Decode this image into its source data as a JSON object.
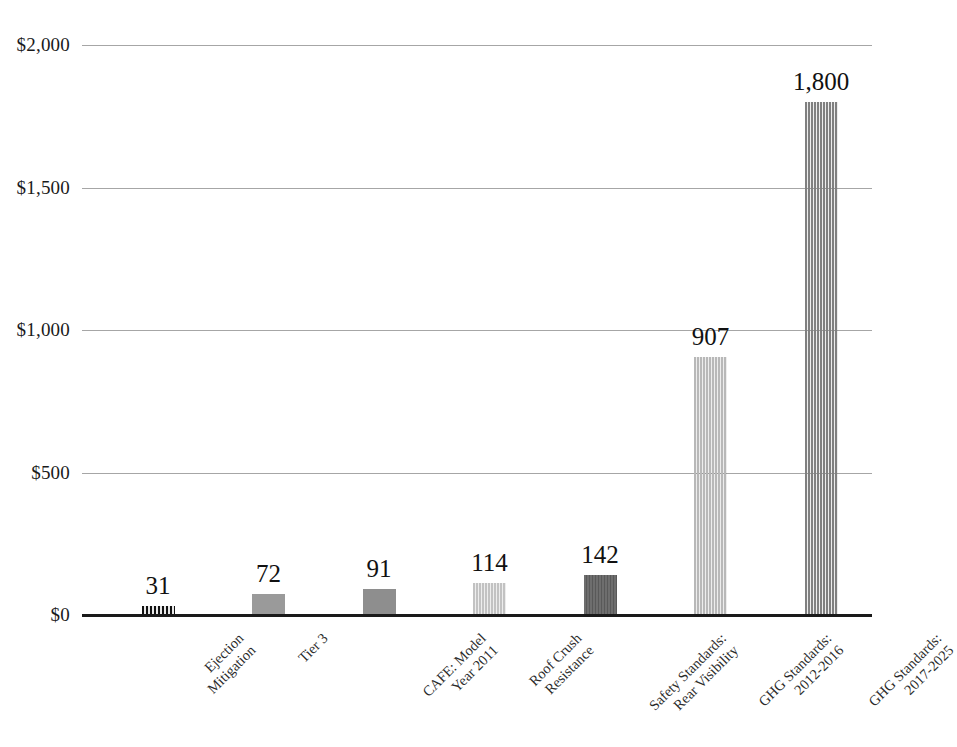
{
  "chart_data": {
    "type": "bar",
    "title": "",
    "subtitle": "",
    "xlabel": "",
    "ylabel": "",
    "ylim": [
      0,
      2000
    ],
    "grid": true,
    "legend": "none",
    "value_prefix": "$",
    "categories": [
      "Ejection Mitigation",
      "Tier 3",
      "CAFE: Model Year 2011",
      "Roof Crush Resistance",
      "Safety Standards: Rear Visibility",
      "GHG Standards: 2012-2016",
      "GHG Standards: 2017-2025"
    ],
    "category_lines": [
      [
        "Ejection",
        "Mitigation"
      ],
      [
        "Tier 3"
      ],
      [
        "CAFE: Model",
        "Year 2011"
      ],
      [
        "Roof Crush",
        "Resistance"
      ],
      [
        "Safety Standards:",
        "Rear Visibility"
      ],
      [
        "GHG Standards:",
        "2012-2016"
      ],
      [
        "GHG Standards:",
        "2017-2025"
      ]
    ],
    "values": [
      31,
      72,
      91,
      114,
      142,
      907,
      1800
    ],
    "value_labels": [
      "31",
      "72",
      "91",
      "114",
      "142",
      "907",
      "1,800"
    ],
    "bar_colors": [
      "#3a3a3a",
      "#9a9a9a",
      "#8e8e8e",
      "#c2c2c2",
      "#6e6e6e",
      "#b8b8b8",
      "#808080"
    ],
    "bar_patterns": [
      "striped-strong",
      "solid",
      "solid",
      "striped-faint",
      "striped-medium",
      "striped-faint",
      "striped-faint"
    ],
    "y_ticks": [
      0,
      500,
      1000,
      1500,
      2000
    ],
    "y_tick_labels": [
      "$0",
      "$500",
      "$1,000",
      "$1,500",
      "$2,000"
    ],
    "gridline_color": "#a6a6a6",
    "axis_color": "#1a1a1a",
    "background_color": "#ffffff"
  }
}
